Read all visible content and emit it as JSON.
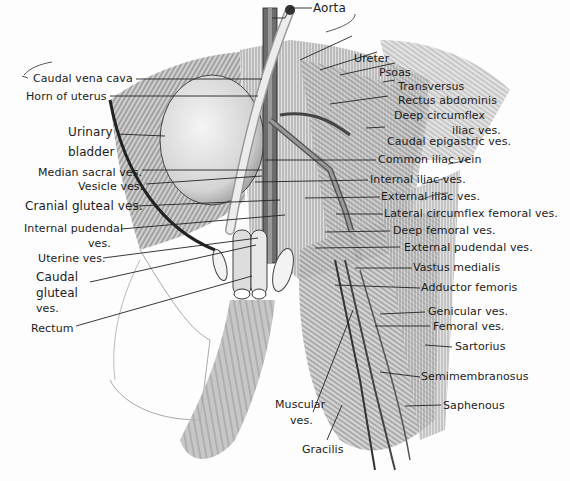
{
  "figure": {
    "colors": {
      "background": "#fdfdfd",
      "text": "#1c1c1c",
      "leader_line": "#222222",
      "shading_dark": "#555555",
      "shading_light": "#bbbbbb"
    }
  },
  "labels": {
    "aorta": "Aorta",
    "caudal_vena_cava": "Caudal vena cava",
    "horn_of_uterus": "Horn of uterus",
    "urinary_bladder_1": "Urinary",
    "urinary_bladder_2": "bladder",
    "median_sacral": "Median sacral ves.",
    "vesicle": "Vesicle  ves.",
    "cranial_gluteal": "Cranial gluteal ves.",
    "internal_pudendal_1": "Internal pudendal",
    "internal_pudendal_2": "ves.",
    "uterine": "Uterine ves.",
    "caudal_gluteal_1": "Caudal",
    "caudal_gluteal_2": "gluteal",
    "caudal_gluteal_3": "ves.",
    "rectum": "Rectum",
    "ureter": "Ureter",
    "psoas": "Psoas",
    "transversus": "Transversus",
    "rectus_abdominis": "Rectus abdominis",
    "deep_circumflex_1": "Deep circumflex",
    "deep_circumflex_2": "iliac ves.",
    "caudal_epigastric": "Caudal epigastric ves.",
    "common_iliac": "Common iliac vein",
    "internal_iliac": "Internal iliac ves.",
    "external_iliac": "External iliac ves.",
    "lateral_circumflex": "Lateral circumflex femoral  ves.",
    "deep_femoral": "Deep femoral ves.",
    "external_pudendal": "External pudendal   ves.",
    "vastus_medialis": "Vastus medialis",
    "adductor_femoris": "Adductor femoris",
    "genicular": "Genicular ves.",
    "femoral": "Femoral ves.",
    "sartorius": "Sartorius",
    "semimembranosus": "Semimembranosus",
    "saphenous": "Saphenous",
    "muscular_1": "Muscular",
    "muscular_2": "ves.",
    "gracilis": "Gracilis"
  }
}
